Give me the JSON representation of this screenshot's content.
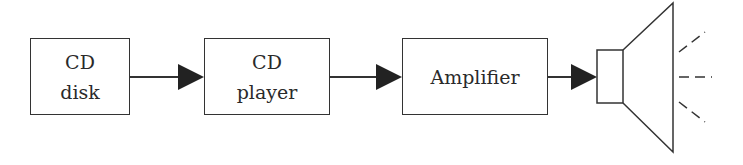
{
  "diagram": {
    "blocks": [
      {
        "id": "cd-disk",
        "lines": [
          "CD",
          "disk"
        ]
      },
      {
        "id": "cd-player",
        "lines": [
          "CD",
          "player"
        ]
      },
      {
        "id": "amplifier",
        "lines": [
          "Amplifier"
        ]
      }
    ],
    "output": {
      "id": "speaker",
      "icon": "speaker-icon"
    },
    "connections": [
      {
        "from": "cd-disk",
        "to": "cd-player"
      },
      {
        "from": "cd-player",
        "to": "amplifier"
      },
      {
        "from": "amplifier",
        "to": "speaker"
      }
    ],
    "colors": {
      "stroke": "#333333",
      "arrowhead": "#222222",
      "background": "#ffffff"
    }
  }
}
